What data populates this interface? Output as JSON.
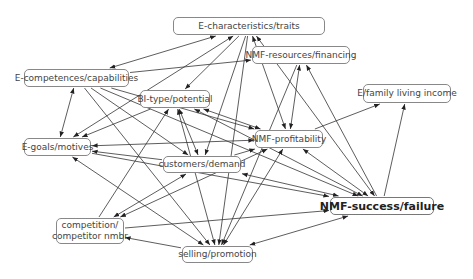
{
  "diagram": {
    "type": "concept-map",
    "nodes": [
      {
        "id": "traits",
        "label": "E-characteristics/traits",
        "x": 173,
        "y": 17,
        "w": 152,
        "h": 18
      },
      {
        "id": "resources",
        "label": "NMF-resources/financing",
        "x": 252,
        "y": 46,
        "w": 98,
        "h": 18
      },
      {
        "id": "competences",
        "label": "E-competences/capabilities",
        "x": 24,
        "y": 69,
        "w": 105,
        "h": 18
      },
      {
        "id": "bitype",
        "label": "BI-type/potential",
        "x": 140,
        "y": 90,
        "w": 70,
        "h": 18
      },
      {
        "id": "income",
        "label": "E/family living income",
        "x": 363,
        "y": 84,
        "w": 88,
        "h": 19
      },
      {
        "id": "profitability",
        "label": "NMF-profitability",
        "x": 255,
        "y": 130,
        "w": 68,
        "h": 18
      },
      {
        "id": "goals",
        "label": "E-goals/motives",
        "x": 24,
        "y": 138,
        "w": 67,
        "h": 18
      },
      {
        "id": "customers",
        "label": "customers/demand",
        "x": 163,
        "y": 156,
        "w": 78,
        "h": 17
      },
      {
        "id": "success",
        "label": "NMF-success/failure",
        "x": 330,
        "y": 197,
        "w": 104,
        "h": 18,
        "bold": true
      },
      {
        "id": "competition",
        "label": "competition/\ncompetitor nmbr",
        "x": 56,
        "y": 218,
        "w": 68,
        "h": 26
      },
      {
        "id": "selling",
        "label": "selling/promotion",
        "x": 182,
        "y": 246,
        "w": 71,
        "h": 17
      }
    ],
    "edges": [
      {
        "from": "traits",
        "to": "competences",
        "bidir": true
      },
      {
        "from": "traits",
        "to": "goals",
        "bidir": true
      },
      {
        "from": "traits",
        "to": "bitype",
        "bidir": false
      },
      {
        "from": "traits",
        "to": "profitability",
        "bidir": true
      },
      {
        "from": "traits",
        "to": "success",
        "bidir": true
      },
      {
        "from": "traits",
        "to": "customers",
        "bidir": false
      },
      {
        "from": "traits",
        "to": "selling",
        "bidir": false
      },
      {
        "from": "competences",
        "to": "resources",
        "bidir": false
      },
      {
        "from": "competences",
        "to": "goals",
        "bidir": true
      },
      {
        "from": "competences",
        "to": "profitability",
        "bidir": false
      },
      {
        "from": "competences",
        "to": "customers",
        "bidir": false
      },
      {
        "from": "competences",
        "to": "selling",
        "bidir": false
      },
      {
        "from": "competences",
        "to": "success",
        "bidir": false
      },
      {
        "from": "bitype",
        "to": "goals",
        "bidir": false
      },
      {
        "from": "bitype",
        "to": "profitability",
        "bidir": true
      },
      {
        "from": "bitype",
        "to": "customers",
        "bidir": true
      },
      {
        "from": "bitype",
        "to": "selling",
        "bidir": true
      },
      {
        "from": "bitype",
        "to": "success",
        "bidir": true
      },
      {
        "from": "competition",
        "to": "bitype",
        "bidir": false
      },
      {
        "from": "resources",
        "to": "profitability",
        "bidir": true
      },
      {
        "from": "success",
        "to": "resources",
        "bidir": false
      },
      {
        "from": "profitability",
        "to": "income",
        "bidir": false
      },
      {
        "from": "success",
        "to": "income",
        "bidir": false
      },
      {
        "from": "profitability",
        "to": "goals",
        "bidir": true
      },
      {
        "from": "customers",
        "to": "goals",
        "bidir": false
      },
      {
        "from": "customers",
        "to": "profitability",
        "bidir": false
      },
      {
        "from": "customers",
        "to": "success",
        "bidir": true
      },
      {
        "from": "customers",
        "to": "competition",
        "bidir": true
      },
      {
        "from": "profitability",
        "to": "competition",
        "bidir": true
      },
      {
        "from": "profitability",
        "to": "success",
        "bidir": true
      },
      {
        "from": "profitability",
        "to": "selling",
        "bidir": true
      },
      {
        "from": "goals",
        "to": "selling",
        "bidir": true
      },
      {
        "from": "goals",
        "to": "success",
        "bidir": false
      },
      {
        "from": "competition",
        "to": "success",
        "bidir": false
      },
      {
        "from": "selling",
        "to": "competition",
        "bidir": false
      },
      {
        "from": "success",
        "to": "selling",
        "bidir": true
      },
      {
        "from": "resources",
        "to": "selling",
        "bidir": false
      }
    ]
  }
}
